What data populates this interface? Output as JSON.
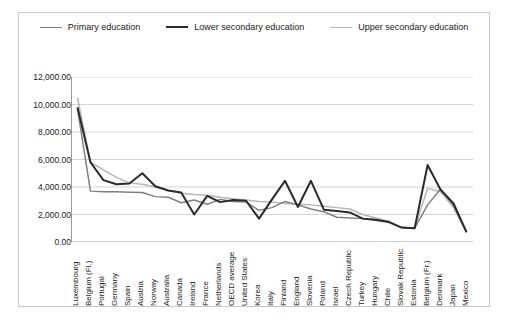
{
  "legend": {
    "position": "top",
    "items": [
      {
        "label": "Primary education",
        "color": "#808080"
      },
      {
        "label": "Lower secondary education",
        "color": "#2b2b2b"
      },
      {
        "label": "Upper secondary education",
        "color": "#b5b5b5"
      }
    ]
  },
  "axis": {
    "y_ticks": [
      "0.00",
      "2,000.00",
      "4,000.00",
      "6,000.00",
      "8,000.00",
      "10,000.00",
      "12,000.00"
    ]
  },
  "chart_data": {
    "type": "line",
    "title": "",
    "xlabel": "",
    "ylabel": "",
    "ylim": [
      0,
      12000
    ],
    "ytick_values": [
      0,
      2000,
      4000,
      6000,
      8000,
      10000,
      12000
    ],
    "grid": true,
    "legend_position": "top",
    "categories": [
      "Luxembourg",
      "Belgium (Fl.)",
      "Portugal",
      "Germany",
      "Spain",
      "Austria",
      "Norway",
      "Australia",
      "Canada",
      "Ireland",
      "France",
      "Netherlands",
      "OECD average",
      "United States",
      "Korea",
      "Italy",
      "Finland",
      "England",
      "Slovenia",
      "Poland",
      "Israel",
      "Czech Republic",
      "Turkey",
      "Hungary",
      "Chile",
      "Slovak Republic",
      "Estonia",
      "Belgium (Fr.)",
      "Denmark",
      "Japan",
      "Mexico"
    ],
    "series": [
      {
        "name": "Primary education",
        "color": "#808080",
        "values": [
          9700,
          3700,
          3650,
          3650,
          3620,
          3600,
          3300,
          3250,
          2850,
          3050,
          2750,
          3100,
          2950,
          2900,
          2300,
          2500,
          2950,
          2700,
          2400,
          2200,
          1800,
          1750,
          1700,
          1650,
          1500,
          1050,
          1000,
          2700,
          3850,
          2650,
          700
        ]
      },
      {
        "name": "Lower secondary education",
        "color": "#2b2b2b",
        "values": [
          9800,
          5800,
          4500,
          4200,
          4250,
          5000,
          4050,
          3750,
          3600,
          2000,
          3350,
          2900,
          3050,
          3000,
          1700,
          3100,
          4450,
          2550,
          4450,
          2350,
          2250,
          2150,
          1700,
          1600,
          1450,
          1050,
          1000,
          5600,
          3800,
          2800,
          720
        ]
      },
      {
        "name": "Upper secondary education",
        "color": "#b5b5b5",
        "values": [
          10500,
          5800,
          5250,
          4700,
          4300,
          4200,
          4000,
          3750,
          3550,
          3450,
          3400,
          3250,
          3150,
          3050,
          2950,
          2900,
          2800,
          2750,
          2700,
          2600,
          2500,
          2400,
          2000,
          1750,
          1500,
          1050,
          1000,
          3900,
          3650,
          2500,
          700
        ]
      }
    ]
  }
}
